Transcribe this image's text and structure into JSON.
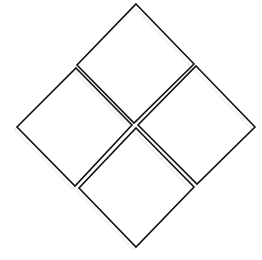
{
  "diagram": {
    "stroke_color": "#111111",
    "shadow_color": "#bdbdbd",
    "background": "#ffffff",
    "shapes": [
      {
        "name": "top",
        "points": [
          [
            136,
            4
          ],
          [
            194,
            64
          ],
          [
            134,
            123
          ],
          [
            77,
            65
          ]
        ]
      },
      {
        "name": "left",
        "points": [
          [
            76,
            68
          ],
          [
            132,
            125
          ],
          [
            75,
            186
          ],
          [
            17,
            127
          ]
        ]
      },
      {
        "name": "right",
        "points": [
          [
            196,
            66
          ],
          [
            255,
            127
          ],
          [
            197,
            184
          ],
          [
            138,
            125
          ]
        ]
      },
      {
        "name": "bottom",
        "points": [
          [
            136,
            128
          ],
          [
            194,
            187
          ],
          [
            136,
            247
          ],
          [
            79,
            188
          ]
        ]
      }
    ]
  }
}
